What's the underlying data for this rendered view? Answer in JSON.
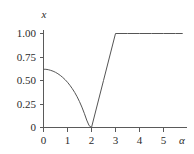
{
  "chart_data": {
    "type": "line",
    "title": "",
    "subtitle": "",
    "xlabel": "α",
    "ylabel": "x",
    "xlim": [
      0,
      5.8
    ],
    "ylim": [
      0,
      1.08
    ],
    "grid": false,
    "legend": null,
    "legend_position": "none",
    "x_ticks": [
      0,
      1,
      2,
      3,
      4,
      5
    ],
    "x_tick_labels": [
      "0",
      "1",
      "2",
      "3",
      "4",
      "5"
    ],
    "y_ticks": [
      0,
      0.25,
      0.5,
      0.75,
      1.0
    ],
    "y_tick_labels": [
      "0",
      "0.25",
      "0.50",
      "0.75",
      "1.00"
    ],
    "series": [
      {
        "name": "x(α)",
        "color": "#555555",
        "x": [
          0.0,
          0.1,
          0.2,
          0.3,
          0.4,
          0.5,
          0.6,
          0.7,
          0.8,
          0.9,
          1.0,
          1.1,
          1.2,
          1.3,
          1.4,
          1.5,
          1.6,
          1.7,
          1.8,
          1.9,
          2.0,
          2.5,
          3.0,
          3.5,
          4.0,
          4.5,
          5.0,
          5.5,
          5.8
        ],
        "values": [
          0.62,
          0.619,
          0.615,
          0.608,
          0.599,
          0.587,
          0.572,
          0.554,
          0.533,
          0.509,
          0.481,
          0.449,
          0.413,
          0.373,
          0.327,
          0.275,
          0.217,
          0.151,
          0.079,
          0.02,
          0.0,
          0.5,
          1.0,
          1.0,
          1.0,
          1.0,
          1.0,
          1.0,
          1.0
        ]
      }
    ],
    "annotations": [
      {
        "label": "minimum",
        "x": 2.0,
        "y": 0.0
      },
      {
        "label": "plateau-start",
        "x": 3.0,
        "y": 1.0
      }
    ]
  },
  "axes": {
    "y_axis_label": "x",
    "x_axis_label": "α",
    "y_tick_labels": [
      "1.00",
      "0.75",
      "0.50",
      "0.25",
      "0"
    ],
    "x_tick_labels": [
      "0",
      "1",
      "2",
      "3",
      "4",
      "5"
    ]
  },
  "colors": {
    "curve": "#555555",
    "axis": "#5a5a5a",
    "text": "#2b2b2b",
    "background": "#ffffff"
  }
}
